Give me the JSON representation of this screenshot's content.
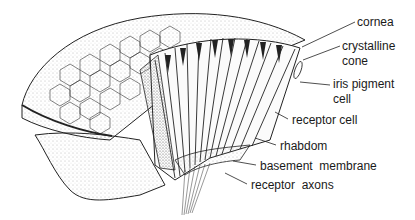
{
  "diagram": {
    "labels": [
      {
        "id": "cornea",
        "text": "cornea",
        "x": 357,
        "y": 16
      },
      {
        "id": "crystalline-cone-1",
        "text": "crystalline",
        "x": 342,
        "y": 40
      },
      {
        "id": "crystalline-cone-2",
        "text": "cone",
        "x": 342,
        "y": 55
      },
      {
        "id": "iris-pigment-1",
        "text": "iris pigment",
        "x": 333,
        "y": 78
      },
      {
        "id": "iris-pigment-2",
        "text": "cell",
        "x": 333,
        "y": 93
      },
      {
        "id": "receptor-cell",
        "text": "receptor cell",
        "x": 292,
        "y": 114
      },
      {
        "id": "rhabdom",
        "text": "rhabdom",
        "x": 280,
        "y": 140
      },
      {
        "id": "basement-membrane",
        "text": "basement  membrane",
        "x": 260,
        "y": 160
      },
      {
        "id": "receptor-axons",
        "text": "receptor  axons",
        "x": 251,
        "y": 179
      }
    ],
    "colors": {
      "ink": "#1a1a1a",
      "background": "#ffffff",
      "stipple": "#9a9a9a"
    }
  }
}
